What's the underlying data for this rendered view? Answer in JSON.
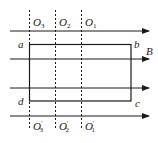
{
  "diagram": {
    "field_label": "B",
    "corners": {
      "a": "a",
      "b": "b",
      "c": "c",
      "d": "d"
    },
    "axes_top": [
      {
        "name": "O",
        "sub": "3"
      },
      {
        "name": "O",
        "sub": "2"
      },
      {
        "name": "O",
        "sub": "1"
      }
    ],
    "axes_bottom": [
      {
        "name": "O",
        "sub": "3",
        "prime": "′"
      },
      {
        "name": "O",
        "sub": "2",
        "prime": "′"
      },
      {
        "name": "O",
        "sub": "1",
        "prime": "′"
      }
    ],
    "field_line_count": 4,
    "colors": {
      "line": "#1a1a1a",
      "background": "#ffffff"
    }
  }
}
